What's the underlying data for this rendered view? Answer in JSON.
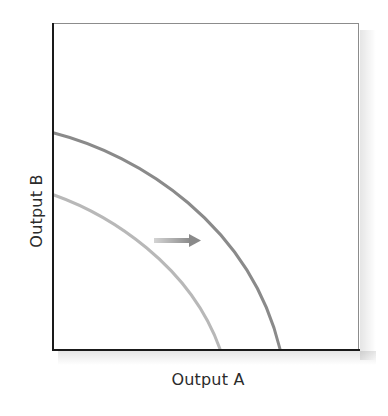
{
  "diagram": {
    "type": "production-possibilities-frontier-shift",
    "x_axis_label": "Output A",
    "y_axis_label": "Output B",
    "curves": [
      {
        "name": "original-frontier",
        "shade": "light",
        "color": "#b8b8b8",
        "y_intercept_px": 195,
        "x_intercept_px": 220
      },
      {
        "name": "shifted-frontier",
        "shade": "dark",
        "color": "#8a8a8a",
        "y_intercept_px": 133,
        "x_intercept_px": 280
      }
    ],
    "arrow": {
      "direction": "right",
      "meaning": "outward shift of frontier",
      "color_start": "#d0d0d0",
      "color_end": "#8a8a8a"
    }
  }
}
